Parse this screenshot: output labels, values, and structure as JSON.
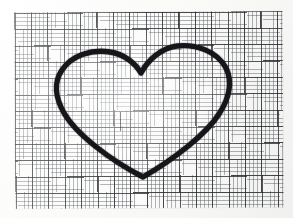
{
  "image": {
    "subject": "hand-drawn-heart-outline",
    "medium": "black marker on graph paper",
    "background_label": "graph paper sheet",
    "canvas": {
      "width": 293,
      "height": 218
    }
  },
  "colors": {
    "page_background": "#ffffff",
    "paper": "#fcfcfb",
    "grid_minor_line": "#464a52",
    "grid_major_line": "#282a30",
    "ink": "#16161a"
  },
  "paper": {
    "left": 15,
    "top": 12,
    "width": 268,
    "height": 196,
    "minor_cell_px": 4.1,
    "major_cell_px": 16.4,
    "rotation_deg": -0.35
  },
  "heart": {
    "label": "heart outline",
    "stroke_width_px": 4.0,
    "top_cusp": {
      "x": 141,
      "y": 73
    },
    "bottom_tip": {
      "x": 143,
      "y": 177
    },
    "left_extreme": {
      "x": 57,
      "y": 98
    },
    "right_extreme": {
      "x": 229,
      "y": 96
    },
    "left_lobe_peak": {
      "x": 101,
      "y": 55
    },
    "right_lobe_peak": {
      "x": 189,
      "y": 50
    },
    "path": "M141,73 C135,63 124,54 110,52 C92,49 72,55 62,70 C53,83 56,99 64,113 C76,134 110,160 143,177 C176,158 207,133 219,114 C229,99 233,82 226,68 C217,51 196,44 177,46 C161,48 148,60 141,73 Z"
  },
  "marks": {
    "stray_tick": {
      "x": 120,
      "y": 112,
      "length": 19,
      "label": "faint pencil tick"
    }
  }
}
